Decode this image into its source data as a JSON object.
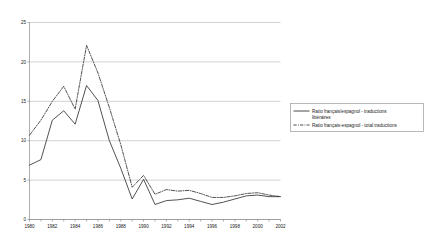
{
  "chart_data": {
    "type": "line",
    "title": "",
    "subtitle": "",
    "xlabel": "",
    "ylabel": "",
    "xlim": [
      1980,
      2002
    ],
    "ylim": [
      0,
      25
    ],
    "ytick_step": 5,
    "yticks": [
      "0",
      "5",
      "10",
      "15",
      "20",
      "25"
    ],
    "xticks": [
      "1980",
      "1982",
      "1984",
      "1986",
      "1988",
      "1990",
      "1992",
      "1994",
      "1996",
      "1998",
      "2000",
      "2002"
    ],
    "x": [
      1980,
      1981,
      1982,
      1983,
      1984,
      1985,
      1986,
      1987,
      1988,
      1989,
      1990,
      1991,
      1992,
      1993,
      1994,
      1995,
      1996,
      1997,
      1998,
      1999,
      2000,
      2001,
      2002
    ],
    "grid": "horizontal",
    "legend_position": "right",
    "series": [
      {
        "name": "Ratio français/espagnol - traductions littéraires",
        "style": "solid",
        "color": "#333333",
        "values": [
          6.9,
          7.6,
          12.6,
          13.8,
          12.1,
          17.0,
          15.1,
          10.0,
          6.5,
          2.6,
          5.1,
          1.9,
          2.4,
          2.5,
          2.7,
          2.3,
          1.9,
          2.2,
          2.6,
          3.0,
          3.1,
          2.9,
          2.9
        ]
      },
      {
        "name": "Ratio français-espagnol - total traductions",
        "style": "dash-dot",
        "color": "#333333",
        "values": [
          10.7,
          12.6,
          15.0,
          16.9,
          14.0,
          22.1,
          18.6,
          14.2,
          9.5,
          4.1,
          5.6,
          3.2,
          3.8,
          3.6,
          3.7,
          3.3,
          2.8,
          2.8,
          3.0,
          3.3,
          3.4,
          3.1,
          2.9
        ]
      }
    ]
  },
  "legend": {
    "entries": [
      {
        "label_line1": "Ratio français/espagnol - traductions",
        "label_line2": "littéraires"
      },
      {
        "label_line1": "Ratio français-espagnol - total traductions",
        "label_line2": ""
      }
    ]
  },
  "colors": {
    "series_line": "#333333",
    "gridline": "#bfbfbf",
    "axis": "#8a8a8a",
    "text": "#1a1a1a",
    "background": "#ffffff",
    "legend_border": "#9a9a9a"
  }
}
